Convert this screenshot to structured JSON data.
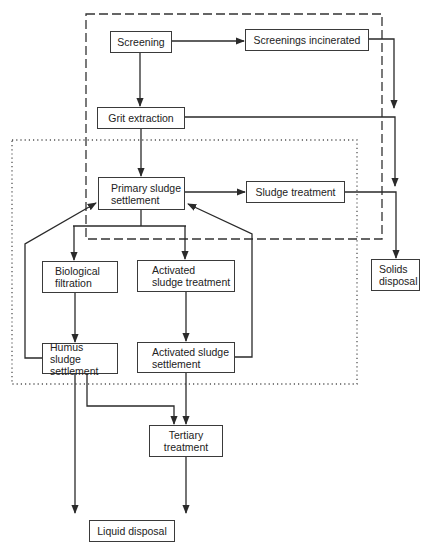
{
  "diagram": {
    "type": "flowchart",
    "title_fragment": "",
    "regions": [
      {
        "name": "dashed-region",
        "style": "dashed"
      },
      {
        "name": "dotted-region",
        "style": "dotted"
      }
    ],
    "nodes": {
      "screening": "Screening",
      "screenings_incinerated": "Screenings  incinerated",
      "grit_extraction": "Grit extraction",
      "primary_settlement": "Primary sludge\nsettlement",
      "sludge_treatment": "Sludge treatment",
      "solids_disposal": "Solids\ndisposal",
      "biological_filtration": "Biological\nfiltration",
      "activated_treatment": "Activated\nsludge treatment",
      "humus_settlement": "Humus sludge\nsettlement",
      "activated_settlement": "Activated sludge\nsettlement",
      "tertiary_treatment": "Tertiary\ntreatment",
      "liquid_disposal": "Liquid disposal"
    },
    "edges": [
      [
        "Screening",
        "Screenings incinerated"
      ],
      [
        "Screening",
        "Grit extraction"
      ],
      [
        "Screenings incinerated",
        "Solids disposal"
      ],
      [
        "Grit extraction",
        "Solids disposal"
      ],
      [
        "Grit extraction",
        "Primary sludge settlement"
      ],
      [
        "Primary sludge settlement",
        "Sludge treatment"
      ],
      [
        "Sludge treatment",
        "Solids disposal"
      ],
      [
        "Primary sludge settlement",
        "Biological filtration"
      ],
      [
        "Primary sludge settlement",
        "Activated sludge treatment"
      ],
      [
        "Biological filtration",
        "Humus sludge settlement"
      ],
      [
        "Activated sludge treatment",
        "Activated sludge settlement"
      ],
      [
        "Humus sludge settlement",
        "Primary sludge settlement"
      ],
      [
        "Activated sludge settlement",
        "Primary sludge settlement"
      ],
      [
        "Humus sludge settlement",
        "Tertiary treatment"
      ],
      [
        "Humus sludge settlement",
        "Liquid disposal"
      ],
      [
        "Activated sludge settlement",
        "Tertiary treatment"
      ],
      [
        "Tertiary treatment",
        "Liquid disposal"
      ]
    ]
  }
}
